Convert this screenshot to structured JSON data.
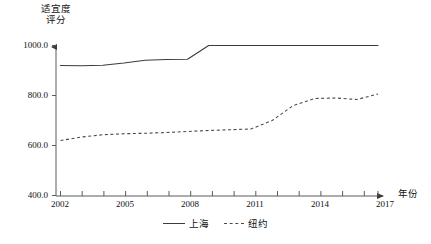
{
  "chart_data": {
    "type": "line",
    "title": "",
    "ylabel": "适宜度\n评分",
    "xlabel": "年份",
    "ylim": [
      400.0,
      1000.0
    ],
    "xlim": [
      2002,
      2017
    ],
    "grid": false,
    "legend_position": "bottom-center",
    "ytick_labels": [
      "1000.0",
      "800.0",
      "600.0",
      "400.0"
    ],
    "ytick_values": [
      1000.0,
      800.0,
      600.0,
      400.0
    ],
    "xtick_labels": [
      "2002",
      "2005",
      "2008",
      "2011",
      "2014",
      "2017"
    ],
    "xtick_values": [
      2002,
      2005,
      2008,
      2011,
      2014,
      2017
    ],
    "x": [
      2002,
      2003,
      2004,
      2005,
      2006,
      2007,
      2008,
      2009,
      2010,
      2011,
      2012,
      2013,
      2014,
      2015,
      2016,
      2017
    ],
    "series": [
      {
        "name": "上海",
        "style": "solid",
        "color": "#3c3c3c",
        "values": [
          920,
          919,
          921,
          930,
          941,
          944,
          945,
          1000,
          1000,
          1000,
          1000,
          1000,
          1000,
          1000,
          1000,
          1000
        ]
      },
      {
        "name": "纽约",
        "style": "dashed",
        "color": "#4a4a4a",
        "values": [
          620,
          634,
          643,
          647,
          649,
          652,
          656,
          660,
          663,
          666,
          700,
          760,
          788,
          790,
          784,
          806
        ]
      }
    ]
  },
  "axes": {
    "y_title": "适宜度\n评分",
    "x_title": "年份",
    "y_ticks": [
      "1000.0",
      "800.0",
      "600.0",
      "400.0"
    ],
    "x_ticks": [
      "2002",
      "2005",
      "2008",
      "2011",
      "2014",
      "2017"
    ]
  },
  "legend": {
    "entries": [
      {
        "label": "上海",
        "style": "solid"
      },
      {
        "label": "纽约",
        "style": "dashed"
      }
    ]
  },
  "colors": {
    "shanghai_line": "#3c3c3c",
    "newyork_line": "#4a4a4a",
    "axis": "#5a5a5a",
    "text": "#111111",
    "background": "#ffffff"
  }
}
